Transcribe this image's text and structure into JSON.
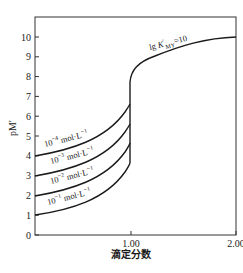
{
  "chart_data": {
    "type": "line",
    "title": "",
    "xlabel": "滴定分数",
    "ylabel": "pM′",
    "xlim": [
      0,
      2.0
    ],
    "ylim": [
      0,
      11
    ],
    "grid": false,
    "x_ticks": [
      "1.00",
      "2.00"
    ],
    "y_ticks": [
      "0",
      "1",
      "2",
      "3",
      "4",
      "5",
      "6",
      "7",
      "8",
      "9",
      "10"
    ],
    "annotation": "lg K′MY=10",
    "series": [
      {
        "name": "10⁻⁴ mol·L⁻¹",
        "label_base": "10",
        "label_exp": "−4",
        "label_unit": " mol·L",
        "x": [
          0,
          0.2,
          0.4,
          0.6,
          0.8,
          0.9,
          0.99,
          1.0
        ],
        "y": [
          4.0,
          4.4,
          4.8,
          5.2,
          5.7,
          6.0,
          6.6,
          6.6
        ]
      },
      {
        "name": "10⁻³ mol·L⁻¹",
        "label_base": "10",
        "label_exp": "−3",
        "label_unit": " mol·L",
        "x": [
          0,
          0.2,
          0.4,
          0.6,
          0.8,
          0.9,
          0.99,
          1.0
        ],
        "y": [
          3.0,
          3.4,
          3.8,
          4.2,
          4.7,
          5.0,
          5.6,
          5.6
        ]
      },
      {
        "name": "10⁻² mol·L⁻¹",
        "label_base": "10",
        "label_exp": "−2",
        "label_unit": " mol·L",
        "x": [
          0,
          0.2,
          0.4,
          0.6,
          0.8,
          0.9,
          0.99,
          1.0
        ],
        "y": [
          2.0,
          2.4,
          2.8,
          3.2,
          3.7,
          4.0,
          4.6,
          4.6
        ]
      },
      {
        "name": "10⁻¹ mol·L⁻¹",
        "label_base": "10",
        "label_exp": "−1",
        "label_unit": " mol·L",
        "x": [
          0,
          0.2,
          0.4,
          0.6,
          0.8,
          0.9,
          0.99,
          1.0
        ],
        "y": [
          1.0,
          1.4,
          1.8,
          2.2,
          2.7,
          3.0,
          3.6,
          3.6
        ]
      },
      {
        "name": "excess (lg K′MY=10)",
        "x": [
          1.0,
          1.01,
          1.05,
          1.1,
          1.3,
          1.5,
          1.7,
          2.0
        ],
        "y": [
          6.6,
          8.0,
          8.3,
          8.5,
          9.1,
          9.5,
          9.8,
          10.0
        ]
      }
    ]
  }
}
